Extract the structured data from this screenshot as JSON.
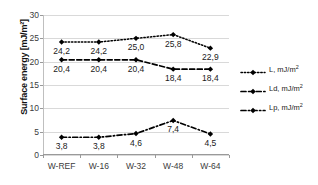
{
  "chart_data": {
    "type": "line",
    "title": "",
    "xlabel": "",
    "ylabel": "Surface energy [mJ/m²]",
    "categories": [
      "W-REF",
      "W-16",
      "W-32",
      "W-48",
      "W-64"
    ],
    "ylim": [
      0,
      30
    ],
    "ytick_labels": [
      "0",
      "5",
      "10",
      "15",
      "20",
      "25",
      "30"
    ],
    "ytick_values": [
      0,
      5,
      10,
      15,
      20,
      25,
      30
    ],
    "grid": "horizontal",
    "legend_position": "right",
    "series": [
      {
        "name": "L, mJ/m²",
        "legend_label_main": "L, mJ/m",
        "legend_label_sup": "2",
        "line_style": "dotted",
        "marker": "diamond",
        "color": "#000000",
        "values": [
          24.2,
          24.2,
          25.0,
          25.8,
          22.9
        ],
        "data_labels": [
          "24,2",
          "24,2",
          "25,0",
          "25,8",
          "22,9"
        ]
      },
      {
        "name": "Ld, mJ/m²",
        "legend_label_main": "Ld, mJ/m",
        "legend_label_sup": "2",
        "line_style": "dashed",
        "marker": "diamond",
        "color": "#000000",
        "values": [
          20.4,
          20.4,
          20.4,
          18.4,
          18.4
        ],
        "data_labels": [
          "20,4",
          "20,4",
          "20,4",
          "18,4",
          "18,4"
        ]
      },
      {
        "name": "Lp, mJ/m²",
        "legend_label_main": "Lp, mJ/m",
        "legend_label_sup": "2",
        "line_style": "dashdot",
        "marker": "diamond",
        "color": "#000000",
        "values": [
          3.8,
          3.8,
          4.6,
          7.4,
          4.5
        ],
        "data_labels": [
          "3,8",
          "3,8",
          "4,6",
          "7,4",
          "4,5"
        ]
      }
    ]
  }
}
